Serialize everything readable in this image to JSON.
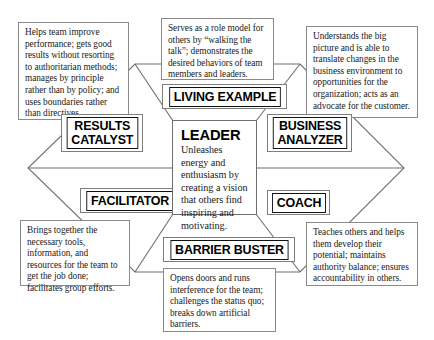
{
  "diagram": {
    "center": {
      "title": "LEADER",
      "description": "Unleashes energy and enthusiasm by creating a vision that others find inspiring and motivating."
    },
    "roles": [
      {
        "id": "results-catalyst",
        "label": "RESULTS CATALYST",
        "label_line1": "RESULTS",
        "label_line2": "CATALYST",
        "description": "Helps team improve performance; gets good results without resorting to authoritarian methods; manages by principle rather than by policy; and uses boundaries rather than directives."
      },
      {
        "id": "living-example",
        "label": "LIVING EXAMPLE",
        "label_line1": "LIVING EXAMPLE",
        "label_line2": "",
        "description": "Serves as a role model for others by “walking the talk”; demonstrates the desired behaviors of team members and leaders."
      },
      {
        "id": "business-analyzer",
        "label": "BUSINESS ANALYZER",
        "label_line1": "BUSINESS",
        "label_line2": "ANALYZER",
        "description": "Understands the big picture and is able to translate changes in the business environment to opportunities for the organization; acts as an advocate for the customer."
      },
      {
        "id": "coach",
        "label": "COACH",
        "label_line1": "COACH",
        "label_line2": "",
        "description": "Teaches others and helps them develop their potential; maintains authority balance; ensures accountability in others."
      },
      {
        "id": "barrier-buster",
        "label": "BARRIER BUSTER",
        "label_line1": "BARRIER BUSTER",
        "label_line2": "",
        "description": "Opens doors and runs interference for the team; challenges the status quo; breaks down artificial barriers."
      },
      {
        "id": "facilitator",
        "label": "FACILITATOR",
        "label_line1": "FACILITATOR",
        "label_line2": "",
        "description": "Brings together the necessary tools, information, and resources for the team to get the job done; facilitates group efforts."
      }
    ],
    "colors": {
      "background": "#ffffff",
      "hexagon_stroke": "#6f6f6f",
      "callout_border": "#8a8a8a",
      "label_border": "#111111",
      "text": "#1a1a1a"
    }
  }
}
